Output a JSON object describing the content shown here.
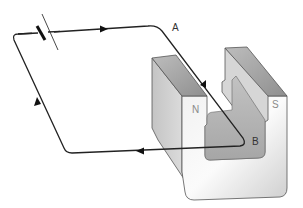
{
  "diagram": {
    "labels": {
      "point_a": "A",
      "point_b": "B",
      "north_pole": "N",
      "south_pole": "S"
    },
    "components": {
      "battery": "battery-cell",
      "magnet": "horseshoe-magnet",
      "wire": "closed-circuit-wire"
    },
    "current_direction": "A-to-B",
    "colors": {
      "wire": "#222222",
      "magnet_front": "#e8e8e8",
      "magnet_top": "#a9a9a9",
      "magnet_side": "#c8c8c8",
      "magnet_inner": "#b4b4b4",
      "outline": "#555555"
    }
  }
}
